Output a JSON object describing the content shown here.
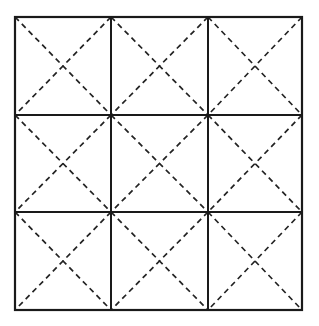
{
  "figure": {
    "name": "dashed-diagonal-grid",
    "background_color": "#ffffff",
    "line_color": "#1a1a1a",
    "dash_color": "#222222"
  },
  "canvas": {
    "width": 319,
    "height": 326
  },
  "grid": {
    "rows": 3,
    "columns": 3,
    "cell_count": 9,
    "origin_x": 15,
    "origin_y": 17,
    "right_x": 302,
    "bottom_y": 310,
    "column_edges": [
      15,
      111,
      208,
      302
    ],
    "row_edges": [
      17,
      115,
      212,
      310
    ],
    "outer_stroke_width": 2.2,
    "inner_stroke_width": 2.0,
    "diagonal_stroke_width": 1.7,
    "diagonal_dash_pattern": "5.5 4.2"
  },
  "cells": [
    {
      "id": "cell-r1c1",
      "row": 1,
      "col": 1,
      "x0": 15,
      "y0": 17,
      "x1": 111,
      "y1": 115
    },
    {
      "id": "cell-r1c2",
      "row": 1,
      "col": 2,
      "x0": 111,
      "y0": 17,
      "x1": 208,
      "y1": 115
    },
    {
      "id": "cell-r1c3",
      "row": 1,
      "col": 3,
      "x0": 208,
      "y0": 17,
      "x1": 302,
      "y1": 115
    },
    {
      "id": "cell-r2c1",
      "row": 2,
      "col": 1,
      "x0": 15,
      "y0": 115,
      "x1": 111,
      "y1": 212
    },
    {
      "id": "cell-r2c2",
      "row": 2,
      "col": 2,
      "x0": 111,
      "y0": 115,
      "x1": 208,
      "y1": 212
    },
    {
      "id": "cell-r2c3",
      "row": 2,
      "col": 3,
      "x0": 208,
      "y0": 115,
      "x1": 302,
      "y1": 212
    },
    {
      "id": "cell-r3c1",
      "row": 3,
      "col": 1,
      "x0": 15,
      "y0": 212,
      "x1": 111,
      "y1": 310
    },
    {
      "id": "cell-r3c2",
      "row": 3,
      "col": 2,
      "x0": 111,
      "y0": 212,
      "x1": 208,
      "y1": 310
    },
    {
      "id": "cell-r3c3",
      "row": 3,
      "col": 3,
      "x0": 208,
      "y0": 212,
      "x1": 302,
      "y1": 310
    }
  ],
  "vertical_dividers": [
    {
      "id": "vdiv-1",
      "x": 111,
      "y0": 17,
      "y1": 310
    },
    {
      "id": "vdiv-2",
      "x": 208,
      "y0": 17,
      "y1": 310
    }
  ],
  "horizontal_dividers": [
    {
      "id": "hdiv-1",
      "y": 115,
      "x0": 15,
      "x1": 302
    },
    {
      "id": "hdiv-2",
      "y": 212,
      "x0": 15,
      "x1": 302
    }
  ],
  "labels": {
    "text_items": []
  }
}
